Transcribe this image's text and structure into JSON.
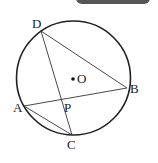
{
  "diagram": {
    "type": "circle-geometry",
    "circle": {
      "center": "O",
      "cx": 73.5,
      "cy": 78,
      "r": 57
    },
    "points": [
      {
        "name": "D",
        "x": 41,
        "y": 31,
        "label_x": 32,
        "label_y": 28
      },
      {
        "name": "B",
        "x": 127,
        "y": 88,
        "label_x": 130,
        "label_y": 93
      },
      {
        "name": "A",
        "x": 24,
        "y": 106,
        "label_x": 13,
        "label_y": 112
      },
      {
        "name": "C",
        "x": 72,
        "y": 135,
        "label_x": 67,
        "label_y": 149
      },
      {
        "name": "P",
        "x": 63,
        "y": 99,
        "label_x": 64,
        "label_y": 112
      },
      {
        "name": "O",
        "x": 73,
        "y": 78,
        "label_x": 77,
        "label_y": 83
      }
    ],
    "segments": [
      "DB",
      "DC",
      "AB",
      "AC"
    ],
    "labels": {
      "D": "D",
      "B": "B",
      "A": "A",
      "C": "C",
      "P": "P",
      "O": "O"
    },
    "colors": {
      "stroke": "#222222",
      "tab": "#565656"
    }
  }
}
